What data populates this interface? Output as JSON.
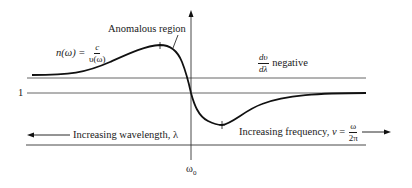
{
  "diagram": {
    "labels": {
      "anomalous_region": "Anomalous region",
      "n_lhs": "n(ω) = ",
      "n_num": "c",
      "n_den": "υ(ω)",
      "dv_num": "dυ",
      "dv_den": "dλ",
      "dv_text": "negative",
      "one": "1",
      "wavelength": "Increasing wavelength, λ",
      "frequency_prefix": "Increasing frequency, ",
      "frequency_var": "ν",
      "frequency_eq": " = ",
      "freq_num": "ω",
      "freq_den": "2π",
      "omega": "ω",
      "omega_sub": "0"
    },
    "colors": {
      "curve": "#111111",
      "lines": "#555555"
    },
    "geometry": {
      "axis_x": 191,
      "upper_line_y": 78,
      "unity_line_y": 93,
      "bottom_line_y": 145,
      "peak": [
        160,
        46
      ],
      "minimum": [
        222,
        125
      ]
    }
  }
}
